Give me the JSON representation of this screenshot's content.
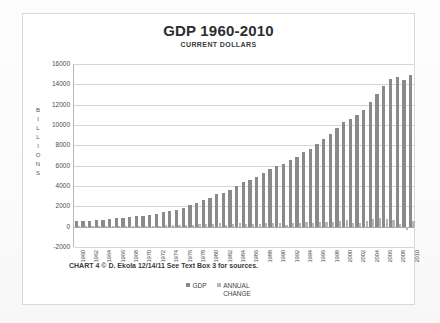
{
  "chart_data": {
    "type": "bar",
    "title": "GDP 1960-2010",
    "subtitle": "CURRENT DOLLARS",
    "ylabel": "BILLIONS",
    "xlabel": "",
    "ylim": [
      -2000,
      16000
    ],
    "yticks": [
      16000,
      14000,
      12000,
      10000,
      8000,
      6000,
      4000,
      2000,
      0,
      -2000
    ],
    "grid": true,
    "legend_position": "bottom",
    "x_tick_step": 2,
    "categories": [
      "1960",
      "1961",
      "1962",
      "1963",
      "1964",
      "1965",
      "1966",
      "1967",
      "1968",
      "1969",
      "1970",
      "1971",
      "1972",
      "1973",
      "1974",
      "1975",
      "1976",
      "1977",
      "1978",
      "1979",
      "1980",
      "1981",
      "1982",
      "1983",
      "1984",
      "1985",
      "1986",
      "1987",
      "1988",
      "1989",
      "1990",
      "1991",
      "1992",
      "1993",
      "1994",
      "1995",
      "1996",
      "1997",
      "1998",
      "1999",
      "2000",
      "2001",
      "2002",
      "2003",
      "2004",
      "2005",
      "2006",
      "2007",
      "2008",
      "2009",
      "2010"
    ],
    "x_visible_ticks": [
      "1960",
      "1962",
      "1964",
      "1966",
      "1968",
      "1970",
      "1972",
      "1974",
      "1976",
      "1978",
      "1980",
      "1982",
      "1984",
      "1986",
      "1988",
      "1990",
      "1992",
      "1994",
      "1996",
      "1998",
      "2000",
      "2002",
      "2004",
      "2006",
      "2008",
      "2010"
    ],
    "series": [
      {
        "name": "GDP",
        "color": "#8a8a8a",
        "values": [
          543,
          563,
          605,
          638,
          685,
          743,
          815,
          862,
          943,
          1020,
          1076,
          1168,
          1282,
          1429,
          1549,
          1689,
          1878,
          2086,
          2357,
          2632,
          2863,
          3211,
          3345,
          3638,
          4041,
          4347,
          4590,
          4870,
          5253,
          5658,
          5980,
          6174,
          6539,
          6879,
          7309,
          7664,
          8100,
          8609,
          9089,
          9661,
          10285,
          10622,
          10978,
          11511,
          12275,
          13094,
          13856,
          14478,
          14719,
          14419,
          14958
        ]
      },
      {
        "name": "ANNUAL CHANGE",
        "color": "#b6b6b6",
        "values": [
          0,
          20,
          42,
          33,
          47,
          58,
          72,
          47,
          81,
          77,
          56,
          92,
          114,
          147,
          120,
          140,
          189,
          208,
          271,
          275,
          231,
          348,
          134,
          293,
          403,
          306,
          243,
          280,
          383,
          405,
          322,
          194,
          365,
          340,
          430,
          355,
          436,
          509,
          480,
          572,
          624,
          337,
          356,
          533,
          764,
          819,
          762,
          622,
          241,
          -300,
          539
        ]
      }
    ],
    "annotations": {
      "caption": "CHART 4 © D. Ekola 12/14/11  See Text Box 3 for sources."
    }
  }
}
